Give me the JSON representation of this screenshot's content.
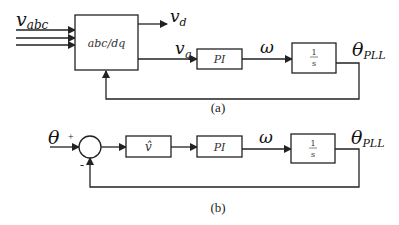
{
  "diagram_a": {
    "caption": "(a)",
    "input_label": "v",
    "input_sub": "abc",
    "transform_block": "abc/dq",
    "output_d_label": "v",
    "output_d_sub": "d",
    "output_q_label": "v",
    "output_q_sub": "q",
    "pi_block": "PI",
    "omega_label": "ω",
    "integrator_num": "1",
    "integrator_den": "s",
    "output_label": "θ",
    "output_sub": "PLL"
  },
  "diagram_b": {
    "caption": "(b)",
    "input_label": "θ",
    "plus_sign": "+",
    "minus_sign": "-",
    "gain_block": "v̂",
    "pi_block": "PI",
    "omega_label": "ω",
    "integrator_num": "1",
    "integrator_den": "s",
    "output_label": "θ",
    "output_sub": "PLL"
  }
}
